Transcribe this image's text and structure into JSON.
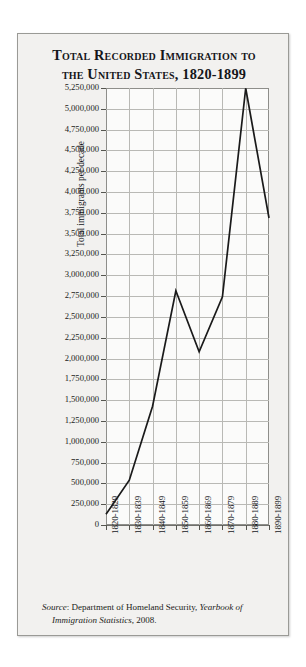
{
  "figure": {
    "title": "Total Recorded Immigration to the United States, 1820-1899",
    "title_line1": "Total Recorded Immigration to",
    "title_line2": "the United States, 1820-1899",
    "source_label": "Source",
    "source_separator": ": ",
    "source_agency": "Department of Homeland Security, ",
    "source_publication": "Yearbook of Immigration Statistics",
    "source_year": ", 2008.",
    "paper_color": "#f2f1ef",
    "line_color": "#1a1a1a",
    "grid_color": "#b9b9b5",
    "text_color": "#15161a"
  },
  "chart_data": {
    "type": "line",
    "title": "Total Recorded Immigration to the United States, 1820-1899",
    "xlabel": "",
    "ylabel": "Total immigrants per decade",
    "categories": [
      "1820-1829",
      "1830-1839",
      "1840-1849",
      "1850-1859",
      "1860-1869",
      "1870-1879",
      "1880-1889",
      "1890-1899"
    ],
    "values": [
      128000,
      538000,
      1427000,
      2814000,
      2081000,
      2742000,
      5247000,
      3688000
    ],
    "ylim": [
      0,
      5250000
    ],
    "ytick_step": 250000,
    "ytick_labels": [
      "5,250,000",
      "5,000,000",
      "4,750,000",
      "4,500,000",
      "4,250,000",
      "4,000,000",
      "3,750,000",
      "3,500,000",
      "3,250,000",
      "3,000,000",
      "2,750,000",
      "2,500,000",
      "2,250,000",
      "2,000,000",
      "1,750,000",
      "1,500,000",
      "1,250,000",
      "1,000,000",
      "750,000",
      "500,000",
      "250,000",
      "0"
    ],
    "ytick_values": [
      5250000,
      5000000,
      4750000,
      4500000,
      4250000,
      4000000,
      3750000,
      3500000,
      3250000,
      3000000,
      2750000,
      2500000,
      2250000,
      2000000,
      1750000,
      1500000,
      1250000,
      1000000,
      750000,
      500000,
      250000,
      0
    ],
    "grid": true,
    "legend": "none",
    "series": [
      {
        "name": "Total immigrants per decade",
        "values": [
          128000,
          538000,
          1427000,
          2814000,
          2081000,
          2742000,
          5247000,
          3688000
        ]
      }
    ]
  }
}
